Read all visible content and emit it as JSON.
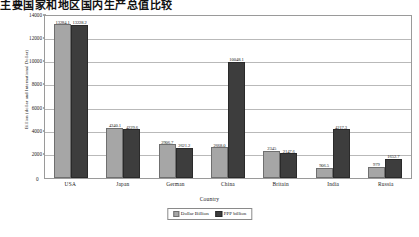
{
  "heading": "主要国家和地区国内生产总值比较",
  "chart_data": {
    "type": "bar",
    "title": "",
    "xlabel": "Country",
    "ylabel": "Billion (dollar and International Dollar)",
    "categories": [
      "USA",
      "Japan",
      "German",
      "China",
      "Britain",
      "India",
      "Russia"
    ],
    "yticks": [
      0,
      2000,
      4000,
      6000,
      8000,
      10000,
      12000,
      14000
    ],
    "ylim": [
      0,
      14000
    ],
    "grid": true,
    "legend_position": "bottom",
    "series": [
      {
        "name": "Dollar Billion",
        "color": "#a6a6a6",
        "values": [
          13284.1,
          4340.1,
          2906.7,
          2668.0,
          2345.0,
          906.5,
          979.0
        ],
        "labels": [
          "13284.1",
          "4340.1",
          "2906.7",
          "2668.0",
          "2345",
          "906.5",
          "979"
        ]
      },
      {
        "name": "PPP billion",
        "color": "#3d3d3d",
        "values": [
          13228.2,
          4229.6,
          2621.2,
          10048.1,
          2147.6,
          4217.3,
          1652.7
        ],
        "labels": [
          "13228.2",
          "4229.6",
          "2621.2",
          "10048.1",
          "2147.6",
          "4217.3",
          "1652.7"
        ]
      }
    ]
  },
  "legend": {
    "items": [
      {
        "label": "Dollar Billion"
      },
      {
        "label": "PPP billion"
      }
    ]
  }
}
